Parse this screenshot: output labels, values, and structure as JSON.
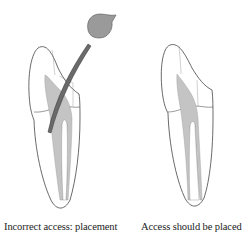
{
  "figure": {
    "panels": [
      {
        "id": "incorrect",
        "caption": "Incorrect access: placement",
        "shows_instrument": true
      },
      {
        "id": "correct",
        "caption": "Access should be placed",
        "shows_instrument": false
      }
    ],
    "colors": {
      "outline": "#444444",
      "pulp": "#c4c4c4",
      "instrument": "#6a6a6a",
      "instrument_head": "#9a9a9a",
      "background": "#ffffff"
    }
  }
}
